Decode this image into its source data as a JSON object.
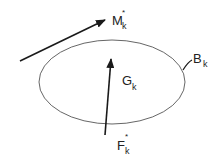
{
  "diagram": {
    "type": "free-body / rigid body sketch",
    "colors": {
      "stroke": "#1a1a1a",
      "ellipse": "#555555",
      "text": "#222222"
    },
    "body": {
      "label": "B",
      "subscript": "k",
      "shape": "ellipse",
      "cx": 112,
      "cy": 82,
      "rx": 73,
      "ry": 42
    },
    "centroid": {
      "label": "G",
      "subscript": "k"
    },
    "force": {
      "label": "F",
      "subscript": "k",
      "superscript": "*"
    },
    "moment": {
      "label": "M",
      "subscript": "k",
      "superscript": "*"
    }
  }
}
